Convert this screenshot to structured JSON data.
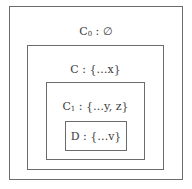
{
  "diagram": {
    "type": "nested-scopes",
    "boxes": [
      {
        "id": "C0",
        "name": "C",
        "subscript": "0",
        "rest": " : ∅"
      },
      {
        "id": "C",
        "name": "C",
        "subscript": "",
        "rest": " : {…x}"
      },
      {
        "id": "C1",
        "name": "C",
        "subscript": "1",
        "rest": " : {…y, z}"
      },
      {
        "id": "D",
        "name": "D",
        "subscript": "",
        "rest": " : {…v}"
      }
    ]
  },
  "colors": {
    "border": "#6b6b6b",
    "text": "#3a3a3a",
    "background": "#ffffff"
  }
}
